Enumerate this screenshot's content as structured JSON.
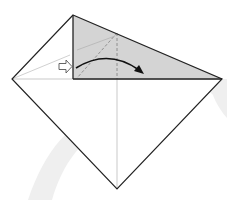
{
  "diagram": {
    "type": "origami-fold-step",
    "colors": {
      "background": "#ffffff",
      "paper_edge": "#222222",
      "shaded_flap": "#d4d4d4",
      "crease_line": "#bbbbbb",
      "dashed_fold": "#888888",
      "arrow": "#111111",
      "watermark": "#eeeeee"
    },
    "shapes": {
      "square_base": [
        [
          73,
          15
        ],
        [
          222,
          79
        ],
        [
          117,
          189
        ],
        [
          12,
          79
        ]
      ],
      "shaded_flap": [
        [
          73,
          15
        ],
        [
          222,
          79
        ],
        [
          73,
          79
        ]
      ],
      "horizontal_crease": [
        [
          12,
          79
        ],
        [
          222,
          79
        ]
      ],
      "vertical_crease": [
        [
          117,
          79
        ],
        [
          117,
          189
        ]
      ],
      "left_crease": [
        [
          12,
          79
        ],
        [
          70,
          55
        ]
      ],
      "valley_fold_vertical": [
        [
          117,
          33
        ],
        [
          117,
          79
        ]
      ],
      "valley_fold_diagonal": [
        [
          117,
          33
        ],
        [
          77,
          78
        ]
      ]
    },
    "symbols": [
      {
        "name": "push-arrow-icon",
        "meaning": "push in / squash",
        "position": [
          62,
          67
        ]
      },
      {
        "name": "fold-over-arrow-icon",
        "meaning": "fold flap to the right",
        "from": [
          76,
          68
        ],
        "to": [
          142,
          72
        ]
      }
    ]
  }
}
